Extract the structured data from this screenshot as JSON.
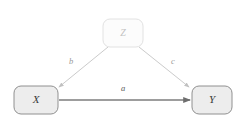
{
  "diagram": {
    "type": "causal-path-diagram",
    "background_color": "#ffffff",
    "title": "",
    "nodes": [
      {
        "id": "Z",
        "label": "Z",
        "role": "confounder",
        "x": 123,
        "y": 33,
        "width": 40,
        "height": 28,
        "fill_color": "#fcfcfc",
        "border_color": "#e2e2e2",
        "text_color": "#c2c2c2",
        "emphasis": "faded"
      },
      {
        "id": "X",
        "label": "X",
        "role": "exposure",
        "x": 36,
        "y": 100,
        "width": 44,
        "height": 28,
        "fill_color": "#ededed",
        "border_color": "#909090",
        "text_color": "#3a3a3a",
        "emphasis": "normal"
      },
      {
        "id": "Y",
        "label": "Y",
        "role": "outcome",
        "x": 212,
        "y": 100,
        "width": 40,
        "height": 28,
        "fill_color": "#ededed",
        "border_color": "#909090",
        "text_color": "#3a3a3a",
        "emphasis": "normal"
      }
    ],
    "edges": [
      {
        "id": "b",
        "label": "b",
        "from": "Z",
        "to": "X",
        "label_x": 71,
        "label_y": 62,
        "color": "#cbcbcb",
        "stroke_width": 1,
        "emphasis": "faded"
      },
      {
        "id": "c",
        "label": "c",
        "from": "Z",
        "to": "Y",
        "label_x": 172,
        "label_y": 62,
        "color": "#cbcbcb",
        "stroke_width": 1,
        "emphasis": "faded"
      },
      {
        "id": "a",
        "label": "a",
        "from": "X",
        "to": "Y",
        "label_x": 123,
        "label_y": 89,
        "color": "#7d7d7d",
        "stroke_width": 1.6,
        "emphasis": "strong"
      }
    ]
  }
}
